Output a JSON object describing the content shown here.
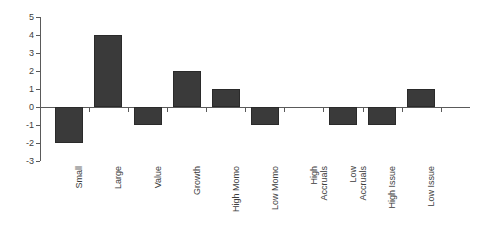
{
  "chart_data": {
    "type": "bar",
    "title": "",
    "subtitle": "",
    "xlabel": "",
    "ylabel": "",
    "categories": [
      "Small",
      "Large",
      "Value",
      "Growth",
      "High Momo",
      "Low Momo",
      "High\nAccruals",
      "Low\nAccruals",
      "High Issue",
      "Low Issue"
    ],
    "values": [
      -2,
      4,
      -1,
      2,
      1,
      -1,
      0,
      -1,
      -1,
      1
    ],
    "ylim": [
      -3,
      5
    ],
    "ytick_labels": [
      "5",
      "4",
      "3",
      "2",
      "1",
      "0",
      "-1",
      "-2",
      "-3"
    ],
    "ytick_values": [
      5,
      4,
      3,
      2,
      1,
      0,
      -1,
      -2,
      -3
    ],
    "grid": false,
    "legend": null,
    "bar_color": "#3a3a3a",
    "bar_border_color": "#2a2a2a",
    "axis_color": "#5a5a5a",
    "background_color": "#ffffff",
    "annotations": []
  }
}
